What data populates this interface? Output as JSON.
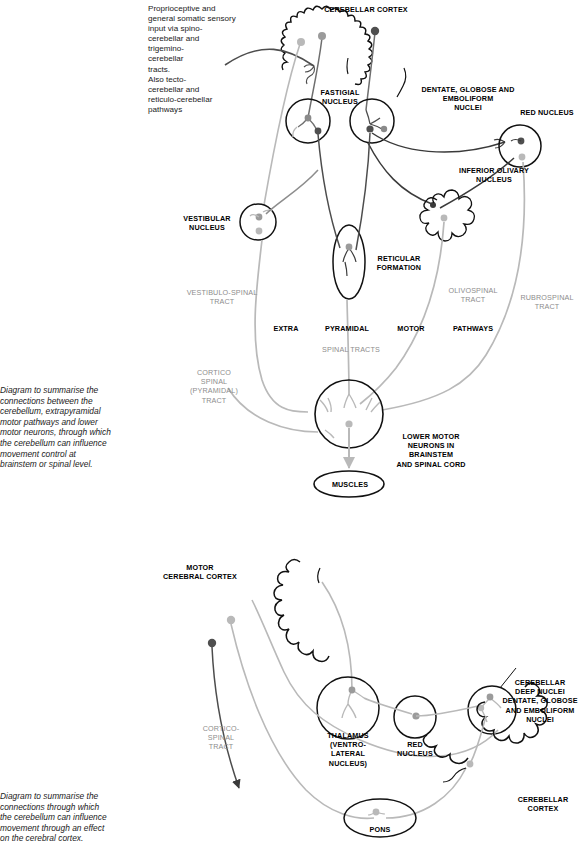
{
  "figure": {
    "title_hidden": "Cerebellar connections diagram",
    "top_panel": {
      "intro_note": "Proprioceptive and\ngeneral somatic sensory\ninput via spino-\ncerebellar and\ntrigemino-\ncerebellar\ntracts.\nAlso tecto-\ncerebellar and\nreticulo-cerebellar\npathways",
      "caption": "Diagram to summarise the\nconnections between the\ncerebellum, extrapyramidal\nmotor pathways and lower\nmotor neurons, through which\nthe cerebellum can influence\nmovement control at\nbrainstem or spinal level.",
      "labels": {
        "cerebellar_cortex": "CEREBELLAR CORTEX",
        "fastigial_nucleus": "FASTIGIAL\nNUCLEUS",
        "dentate_globose_emboliform": "DENTATE, GLOBOSE AND\nEMBOLIFORM\nNUCLEI",
        "red_nucleus": "RED NUCLEUS",
        "inferior_olivary_nucleus": "INFERIOR OLIVARY\nNUCLEUS",
        "vestibular_nucleus": "VESTIBULAR\nNUCLEUS",
        "reticular_formation": "RETICULAR\nFORMATION",
        "vestibulospinal_tract": "VESTIBULO-SPINAL\nTRACT",
        "olivospinal_tract": "OLIVOSPINAL\nTRACT",
        "rubrospinal_tract": "RUBROSPINAL\nTRACT",
        "corticospinal_tract": "CORTICO\nSPINAL\n(PYRAMIDAL)\nTRACT",
        "band_extra": "EXTRA",
        "band_pyramidal": "PYRAMIDAL",
        "band_motor": "MOTOR",
        "band_pathways": "PATHWAYS",
        "band_spinal_tracts": "SPINAL   TRACTS",
        "lower_motor_neurons": "LOWER MOTOR\nNEURONS IN\nBRAINSTEM\nAND SPINAL CORD",
        "muscles": "MUSCLES"
      }
    },
    "bottom_panel": {
      "caption": "Diagram to summarise the\nconnections through which\nthe cerebellum can influence\nmovement through an effect\non the cerebral cortex.",
      "labels": {
        "motor_cerebral_cortex": "MOTOR\nCEREBRAL CORTEX",
        "thalamus": "THALAMUS\n(VENTRO-\nLATERAL\nNUCLEUS)",
        "red_nucleus": "RED\nNUCLEUS",
        "cerebellar_deep_nuclei": "CEREBELLAR\nDEEP NUCLEI\nDENTATE, GLOBOSE\nAND EMBOLIFORM\nNUCLEI",
        "cerebellar_cortex": "CEREBELLAR\nCORTEX",
        "corticospinal_tract": "CORTICO-\nSPINAL\nTRACT",
        "pons": "PONS"
      }
    },
    "colors": {
      "ink_black": "#111111",
      "tract_dark": "#4d4d4d",
      "tract_mid": "#6e6e6e",
      "tract_light": "#b9b9b9",
      "label_grey": "#8d8d8d",
      "background": "#ffffff"
    }
  }
}
